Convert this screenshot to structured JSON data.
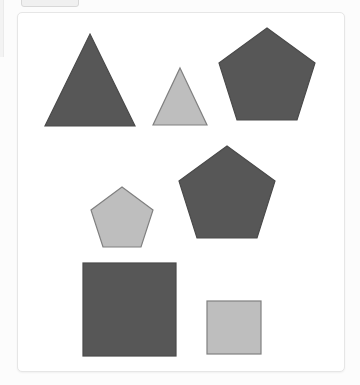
{
  "page": {
    "background_color": "#fcfcfc",
    "width": 360,
    "height": 385
  },
  "chrome": {
    "top_chip": {
      "name": "clipped-toolbar-chip",
      "fill": "#f0f0f0",
      "border": "#d8d8d8"
    },
    "left_rail": {
      "name": "clipped-left-rail",
      "fill": "#f3f3f3"
    }
  },
  "card": {
    "background_color": "#ffffff",
    "border_color": "#e6e6e6",
    "corner_radius": 5
  },
  "palette": {
    "dark_fill": "#575757",
    "dark_stroke": "#4a4a4a",
    "light_fill": "#bebebe",
    "light_stroke": "#808080"
  },
  "shapes": [
    {
      "id": "triangle-large-dark",
      "type": "triangle",
      "size": "large",
      "shade": "dark",
      "fill": "#575757",
      "stroke": "#4a4a4a",
      "points": "72,21 117,113 27,113",
      "center": [
        72,
        82
      ]
    },
    {
      "id": "triangle-small-light",
      "type": "triangle",
      "size": "small",
      "shade": "light",
      "fill": "#bebebe",
      "stroke": "#808080",
      "points": "162,55 189,112 135,112",
      "center": [
        162,
        93
      ]
    },
    {
      "id": "pentagon-large-dark-top",
      "type": "pentagon",
      "size": "large",
      "shade": "dark",
      "fill": "#575757",
      "stroke": "#4a4a4a",
      "points": "249,15 297,50 279,107 219,107 201,50",
      "center": [
        249,
        63
      ]
    },
    {
      "id": "pentagon-small-light",
      "type": "pentagon",
      "size": "small",
      "shade": "light",
      "fill": "#bebebe",
      "stroke": "#808080",
      "points": "104,174 135,197 123,234 85,234 73,197",
      "center": [
        104,
        205
      ]
    },
    {
      "id": "pentagon-large-dark-mid",
      "type": "pentagon",
      "size": "large",
      "shade": "dark",
      "fill": "#575757",
      "stroke": "#4a4a4a",
      "points": "209,133 257,168 239,225 179,225 161,168",
      "center": [
        209,
        181
      ]
    },
    {
      "id": "square-large-dark",
      "type": "square",
      "size": "large",
      "shade": "dark",
      "fill": "#575757",
      "stroke": "#4a4a4a",
      "rect": [
        65,
        250,
        93,
        93
      ]
    },
    {
      "id": "square-small-light",
      "type": "square",
      "size": "small",
      "shade": "light",
      "fill": "#bebebe",
      "stroke": "#808080",
      "rect": [
        189,
        288,
        54,
        53
      ]
    }
  ]
}
